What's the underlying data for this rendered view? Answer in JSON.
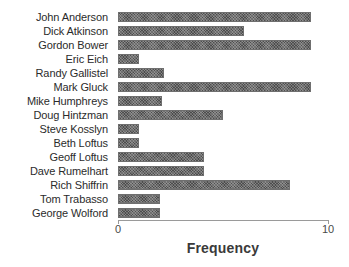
{
  "chart_data": {
    "type": "bar",
    "orientation": "horizontal",
    "title": "",
    "xlabel": "Frequency",
    "ylabel": "",
    "xlim": [
      0,
      10
    ],
    "xticks": [
      "0",
      "10"
    ],
    "grid": false,
    "legend": null,
    "bar_style": {
      "fill": "#6e6e6e",
      "edge": "#6f6f6f",
      "hatch": "cross-hatch"
    },
    "categories": [
      "John Anderson",
      "Dick Atkinson",
      "Gordon Bower",
      "Eric Eich",
      "Randy Gallistel",
      "Mark Gluck",
      "Mike Humphreys",
      "Doug Hintzman",
      "Steve Kosslyn",
      "Beth Loftus",
      "Geoff Loftus",
      "Dave Rumelhart",
      "Rich Shiffrin",
      "Tom Trabasso",
      "George Wolford"
    ],
    "values": [
      9.2,
      6,
      9.2,
      1,
      2.2,
      9.2,
      2.1,
      5,
      1,
      1,
      4.1,
      4.1,
      8.2,
      2,
      2
    ]
  }
}
